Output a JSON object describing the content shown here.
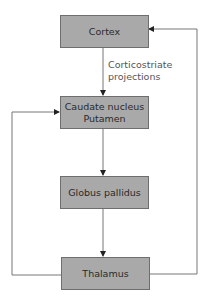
{
  "nodes": {
    "cortex": {
      "label": "Cortex"
    },
    "caudate": {
      "line1": "Caudate nucleus",
      "line2": "Putamen"
    },
    "globus": {
      "label": "Globus pallidus"
    },
    "thalamus": {
      "label": "Thalamus"
    }
  },
  "edges": {
    "cortex_to_caudate": {
      "line1": "Corticostriate",
      "line2": "projections"
    }
  },
  "colors": {
    "box_fill": "#a9a9a9",
    "box_border": "#6e6e6e",
    "line": "#777777"
  }
}
